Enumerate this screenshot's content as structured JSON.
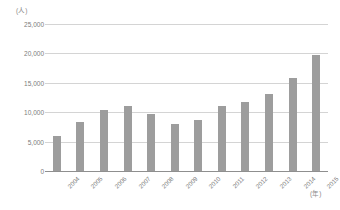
{
  "chart_data": {
    "type": "bar",
    "title": "",
    "subtitle": "",
    "xlabel": "(年)",
    "ylabel": "(人)",
    "categories": [
      "2004",
      "2005",
      "2006",
      "2007",
      "2008",
      "2009",
      "2010",
      "2011",
      "2012",
      "2013",
      "2014",
      "2015"
    ],
    "values": [
      6000,
      8300,
      10300,
      11100,
      9700,
      8000,
      8750,
      11100,
      11800,
      13100,
      15900,
      19700
    ],
    "series": [
      {
        "name": "",
        "values": [
          6000,
          8300,
          10300,
          11100,
          9700,
          8000,
          8750,
          11100,
          11800,
          13100,
          15900,
          19700
        ]
      }
    ],
    "ylim": [
      0,
      25000
    ],
    "yticks": [
      0,
      5000,
      10000,
      15000,
      20000,
      25000
    ],
    "ytick_labels": [
      "0",
      "5,000",
      "10,000",
      "15,000",
      "20,000",
      "25,000"
    ],
    "grid": true,
    "legend": false,
    "legend_position": "none",
    "bar_color": "#9d9d9d",
    "gridline_color": "#d4d4d4",
    "axis_color": "#8f8f8f",
    "background_color": "#ffffff"
  }
}
